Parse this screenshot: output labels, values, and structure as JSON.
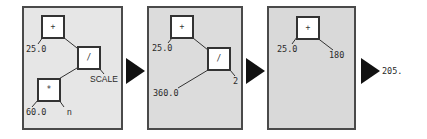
{
  "colors": {
    "panel_border": "#4a4a4a",
    "panel_bg_1": "#e6e6e6",
    "panel_bg_2": "#dcdcdc",
    "panel_bg_3": "#d9d9d9",
    "node_bg": "#ffffff",
    "arrow": "#111111"
  },
  "steps": [
    {
      "nodes": [
        {
          "id": "plus",
          "op": "+"
        },
        {
          "id": "div",
          "op": "/"
        },
        {
          "id": "mul",
          "op": "*"
        }
      ],
      "leaves": {
        "plus_left": "25.0",
        "div_right": "SCALE",
        "mul_left": "60.0",
        "mul_right": "n"
      }
    },
    {
      "nodes": [
        {
          "id": "plus",
          "op": "+"
        },
        {
          "id": "div",
          "op": "/"
        }
      ],
      "leaves": {
        "plus_left": "25.0",
        "div_left": "360.0",
        "div_right": "2"
      }
    },
    {
      "nodes": [
        {
          "id": "plus",
          "op": "+"
        }
      ],
      "leaves": {
        "plus_left": "25.0",
        "plus_right": "180"
      }
    }
  ],
  "result": "205."
}
